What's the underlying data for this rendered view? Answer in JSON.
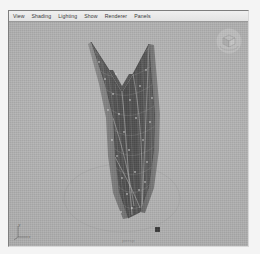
{
  "window": {
    "title": "3D Viewport"
  },
  "menubar": {
    "items": [
      {
        "label": "View"
      },
      {
        "label": "Shading"
      },
      {
        "label": "Lighting"
      },
      {
        "label": "Show"
      },
      {
        "label": "Renderer"
      },
      {
        "label": "Panels"
      }
    ]
  },
  "viewport": {
    "caption": "persp",
    "background_color": "#b0b0b0",
    "shading_mode": "smooth-shaded-wireframe",
    "axis_gizmo": {
      "name": "axis-gizmo",
      "labels": [
        "y",
        "x",
        "z"
      ]
    },
    "view_cube": {
      "name": "view-cube",
      "face_label": ""
    },
    "model": {
      "name": "leaf-mesh",
      "description": "tapered leaf / hull shaped polygon mesh with V-notch at top",
      "surface_color": "#5a5a5a",
      "wireframe_color": "#9a9a9a",
      "vertex_color": "#ffffff",
      "selected": false
    },
    "ground_circle": {
      "name": "ground-circle",
      "color": "#a0a0a0"
    },
    "helper_object": {
      "name": "helper-square",
      "color": "#3c3c3c"
    }
  },
  "colors": {
    "panel_bg": "#b2b2b2",
    "menubar_bg": "#eaeaea",
    "page_bg": "#f4f4f4",
    "text": "#3a3a3a"
  }
}
